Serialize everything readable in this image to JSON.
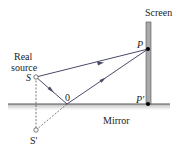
{
  "diagram": {
    "labels": {
      "screen": "Screen",
      "real_source_line1": "Real",
      "real_source_line2": "source",
      "source": "S",
      "point_p": "P",
      "point_p_prime": "P'",
      "point_o": "0",
      "mirror": "Mirror",
      "image_source": "S'"
    },
    "colors": {
      "ray": "#4a4a6a",
      "mirror_line": "#555555",
      "mirror_shadow": "#c8c8c8",
      "screen_fill": "#a9a9a9",
      "screen_edge": "#555555",
      "dashed": "#444444",
      "point": "#000000"
    },
    "points": {
      "S": [
        36,
        77
      ],
      "P": [
        148,
        49
      ],
      "O": [
        67,
        104
      ],
      "P_prime": [
        148,
        104
      ],
      "S_prime": [
        36,
        130
      ]
    }
  }
}
